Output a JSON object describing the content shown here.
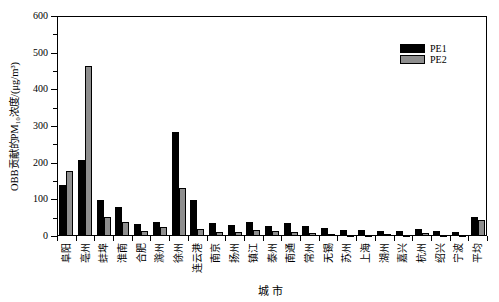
{
  "chart_data": {
    "type": "bar",
    "title": "",
    "xlabel": "城市",
    "ylabel": "OBB贡献的PM₁₀浓度/(μg/m³)",
    "categories": [
      "阜阳",
      "亳州",
      "蚌埠",
      "淮南",
      "合肥",
      "滁州",
      "徐州",
      "连云港",
      "南京",
      "扬州",
      "镇江",
      "泰州",
      "南通",
      "常州",
      "无锡",
      "苏州",
      "上海",
      "湖州",
      "嘉兴",
      "杭州",
      "绍兴",
      "宁波",
      "平均"
    ],
    "series": [
      {
        "name": "PE1",
        "color": "#000000",
        "values": [
          138,
          208,
          98,
          78,
          32,
          38,
          283,
          97,
          35,
          30,
          37,
          28,
          36,
          26,
          21,
          17,
          16,
          15,
          13,
          20,
          14,
          10,
          53
        ]
      },
      {
        "name": "PE2",
        "color": "#8e8e8e",
        "values": [
          176,
          465,
          53,
          38,
          13,
          25,
          132,
          18,
          11,
          11,
          16,
          13,
          12,
          7,
          5,
          4,
          3,
          5,
          4,
          8,
          4,
          3,
          43
        ]
      }
    ],
    "ylim": [
      0,
      600
    ],
    "yticks": [
      0,
      100,
      200,
      300,
      400,
      500,
      600
    ],
    "y_minor_step": 50,
    "grid": false,
    "legend": {
      "position": "inside-top-right",
      "entries": [
        "PE1",
        "PE2"
      ]
    },
    "colors": {
      "pe1": "#000000",
      "pe2": "#8e8e8e",
      "axis": "#000000",
      "background": "#ffffff"
    }
  }
}
